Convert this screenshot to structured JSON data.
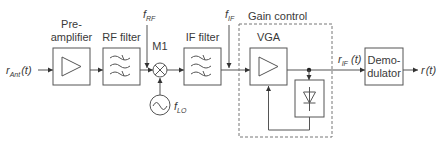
{
  "diagram": {
    "colors": {
      "line": "#555555",
      "text": "#3a3a3a",
      "dashed": "#777777",
      "background": "#ffffff"
    },
    "input": {
      "symbol": "r",
      "subscript": "Ant",
      "arg": "(t)"
    },
    "blocks": {
      "preamp": {
        "label_line1": "Pre-",
        "label_line2": "amplifier",
        "icon": "amplifier-triangle-icon"
      },
      "rf_filter": {
        "label": "RF filter",
        "icon": "bandpass-filter-icon"
      },
      "mixer": {
        "label": "M1",
        "icon": "mixer-x-circle-icon"
      },
      "lo": {
        "icon": "sine-oscillator-icon",
        "symbol": "f",
        "subscript": "LO"
      },
      "if_filter": {
        "label": "IF filter",
        "icon": "bandpass-filter-icon"
      },
      "gain_control": {
        "label": "Gain control"
      },
      "vga": {
        "label": "VGA",
        "icon": "amplifier-triangle-icon"
      },
      "detector": {
        "icon": "diode-icon"
      },
      "demodulator": {
        "label_line1": "Demo-",
        "label_line2": "dulator"
      }
    },
    "signals": {
      "f_rf": {
        "symbol": "f",
        "subscript": "RF"
      },
      "f_if": {
        "symbol": "f",
        "subscript": "IF"
      },
      "r_if": {
        "symbol": "r",
        "subscript": "IF",
        "arg": " (t)"
      },
      "output": {
        "symbol": "r",
        "arg": "(t)"
      }
    }
  }
}
